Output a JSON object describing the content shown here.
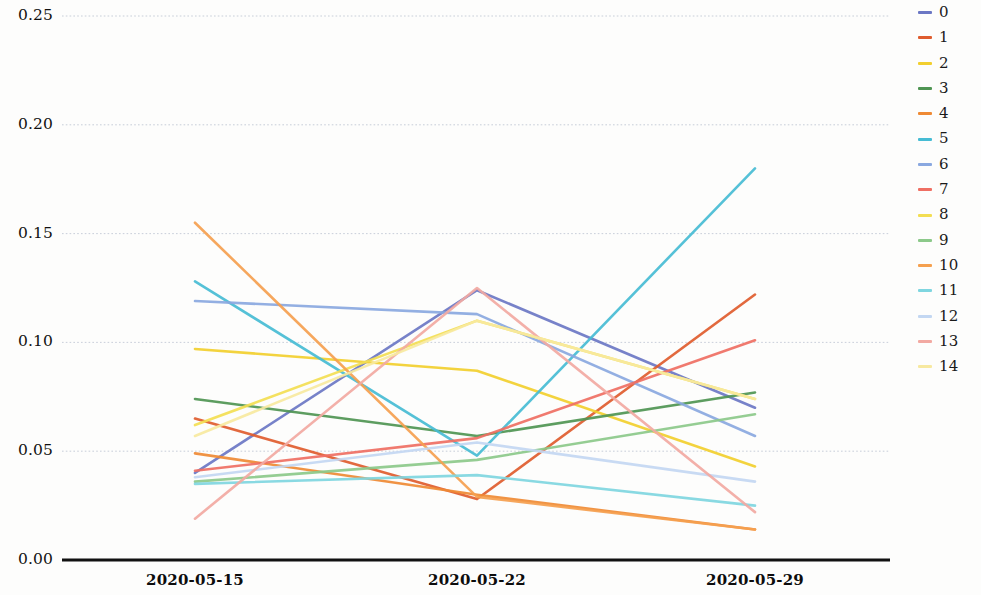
{
  "chart_data": {
    "type": "line",
    "title": "",
    "xlabel": "",
    "ylabel": "",
    "categories": [
      "2020-05-15",
      "2020-05-22",
      "2020-05-29"
    ],
    "xticklabels": [
      "2020-05-15",
      "2020-05-22",
      "2020-05-29"
    ],
    "yticklabels": [
      "0.00",
      "0.05",
      "0.10",
      "0.15",
      "0.20",
      "0.25"
    ],
    "ytickvalues": [
      0.0,
      0.05,
      0.1,
      0.15,
      0.2,
      0.25
    ],
    "ylim": [
      0.0,
      0.256
    ],
    "grid": true,
    "grid_axis": "y",
    "legend_position": "right",
    "legend_title": "",
    "series": [
      {
        "name": "0",
        "color": "#6b77c4",
        "values": [
          0.04,
          0.124,
          0.07
        ]
      },
      {
        "name": "1",
        "color": "#df5c2e",
        "values": [
          0.065,
          0.028,
          0.122
        ]
      },
      {
        "name": "2",
        "color": "#f2cf2e",
        "values": [
          0.097,
          0.087,
          0.043
        ]
      },
      {
        "name": "3",
        "color": "#4f9553",
        "values": [
          0.074,
          0.057,
          0.077
        ]
      },
      {
        "name": "4",
        "color": "#ef8a34",
        "values": [
          0.049,
          0.03,
          0.014
        ]
      },
      {
        "name": "5",
        "color": "#46bcd4",
        "values": [
          0.128,
          0.048,
          0.18
        ]
      },
      {
        "name": "6",
        "color": "#8aa8e0",
        "values": [
          0.119,
          0.113,
          0.057
        ]
      },
      {
        "name": "7",
        "color": "#ef6f63",
        "values": [
          0.041,
          0.056,
          0.101
        ]
      },
      {
        "name": "8",
        "color": "#f3de52",
        "values": [
          0.062,
          0.11,
          0.074
        ]
      },
      {
        "name": "9",
        "color": "#8cc98a",
        "values": [
          0.036,
          0.046,
          0.067
        ]
      },
      {
        "name": "10",
        "color": "#f5a04f",
        "values": [
          0.155,
          0.029,
          0.014
        ]
      },
      {
        "name": "11",
        "color": "#7fd6e0",
        "values": [
          0.035,
          0.039,
          0.025
        ]
      },
      {
        "name": "12",
        "color": "#c3d7f2",
        "values": [
          0.038,
          0.054,
          0.036
        ]
      },
      {
        "name": "13",
        "color": "#f2a9a2",
        "values": [
          0.019,
          0.125,
          0.022
        ]
      },
      {
        "name": "14",
        "color": "#f7e9a0",
        "values": [
          0.057,
          0.11,
          0.074
        ]
      }
    ]
  },
  "legend": {
    "items": [
      {
        "label": "0"
      },
      {
        "label": "1"
      },
      {
        "label": "2"
      },
      {
        "label": "3"
      },
      {
        "label": "4"
      },
      {
        "label": "5"
      },
      {
        "label": "6"
      },
      {
        "label": "7"
      },
      {
        "label": "8"
      },
      {
        "label": "9"
      },
      {
        "label": "10"
      },
      {
        "label": "11"
      },
      {
        "label": "12"
      },
      {
        "label": "13"
      },
      {
        "label": "14"
      }
    ]
  },
  "axes": {
    "axis_line_color": "#111111",
    "grid_color": "#b9c1cf"
  }
}
